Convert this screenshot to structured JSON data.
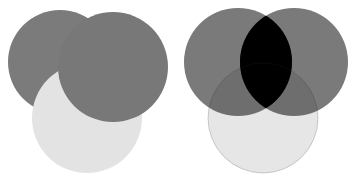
{
  "figure": {
    "panels": [
      {
        "id": "normal",
        "blend": "normal",
        "circles": [
          {
            "name": "back-left-circle",
            "cx": 60,
            "cy": 62,
            "r": 52,
            "color": "#7b7b7b"
          },
          {
            "name": "light-bottom-circle",
            "cx": 87,
            "cy": 118,
            "r": 55,
            "color": "#e3e3e3"
          },
          {
            "name": "front-right-circle",
            "cx": 113,
            "cy": 67,
            "r": 55,
            "color": "#787878"
          }
        ]
      },
      {
        "id": "multiply",
        "blend": "multiply",
        "circles": [
          {
            "name": "light-bottom-circle",
            "cx": 88,
            "cy": 118,
            "r": 55,
            "color": "#e6e6e6"
          },
          {
            "name": "left-circle",
            "cx": 63,
            "cy": 62,
            "r": 54,
            "color": "#7a7a7a"
          },
          {
            "name": "right-circle",
            "cx": 119,
            "cy": 62,
            "r": 54,
            "color": "#7a7a7a"
          },
          {
            "name": "overlap-lens",
            "color": "#000000"
          }
        ]
      }
    ]
  }
}
